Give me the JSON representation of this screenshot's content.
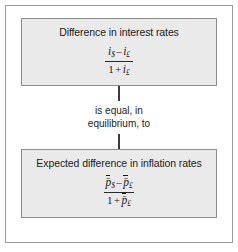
{
  "figure": {
    "top_box": {
      "title": "Difference in interest rates",
      "formula": {
        "numerator": {
          "left_var": "i",
          "left_sub": "$",
          "operator": "–",
          "right_var": "i",
          "right_sub": "£"
        },
        "denominator": {
          "one": "1",
          "operator": "+",
          "var": "i",
          "sub": "£"
        }
      }
    },
    "connector": {
      "label_line1": "is equal, in",
      "label_line2": "equilibrium, to"
    },
    "bottom_box": {
      "title": "Expected difference in inflation rates",
      "formula": {
        "numerator": {
          "left_var": "p̄",
          "left_sub": "$",
          "operator": "–",
          "right_var": "p̄",
          "right_sub": "£"
        },
        "denominator": {
          "one": "1",
          "operator": "+",
          "var": "p̄",
          "sub": "£"
        }
      }
    },
    "colors": {
      "box_fill": "#eaeaea",
      "box_border": "#8c8c8c",
      "frame_border": "#9a9a9a",
      "connector": "#3a3a3a",
      "text": "#1c1c1c"
    }
  }
}
